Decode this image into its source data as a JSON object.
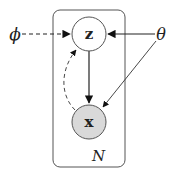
{
  "diagram": {
    "type": "graphical-model-plate-notation",
    "nodes": {
      "z": {
        "label": "z",
        "observed": false,
        "fill": "#ffffff"
      },
      "x": {
        "label": "x",
        "observed": true,
        "fill": "#d9d9d9"
      },
      "phi": {
        "label": "ϕ"
      },
      "theta": {
        "label": "θ"
      }
    },
    "plate": {
      "label": "N"
    },
    "edges": [
      {
        "from": "phi",
        "to": "z",
        "style": "dashed"
      },
      {
        "from": "theta",
        "to": "z",
        "style": "solid"
      },
      {
        "from": "theta",
        "to": "x",
        "style": "solid"
      },
      {
        "from": "z",
        "to": "x",
        "style": "solid"
      },
      {
        "from": "x",
        "to": "z",
        "style": "dashed-curved"
      }
    ]
  }
}
